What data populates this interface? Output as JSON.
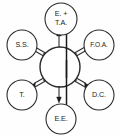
{
  "diagram": {
    "type": "hub-and-spoke",
    "background_color": "#fefefe",
    "stroke_color": "#2b2b2b",
    "text_color": "#1a1a1a",
    "hub": {
      "name": "central-hub",
      "label": "",
      "cx": 60,
      "cy": 67,
      "r": 20
    },
    "nodes": [
      {
        "id": "top",
        "name": "node-eta",
        "label_line1": "E. +",
        "label_line2": "T.A.",
        "cx": 61,
        "cy": 19,
        "r": 16,
        "two_line": true
      },
      {
        "id": "upper-left",
        "name": "node-ss",
        "label_line1": "S.S.",
        "label_line2": "",
        "cx": 22,
        "cy": 45,
        "r": 15,
        "two_line": false
      },
      {
        "id": "upper-right",
        "name": "node-foa",
        "label_line1": "F.O.A.",
        "label_line2": "",
        "cx": 99,
        "cy": 45,
        "r": 15,
        "two_line": false
      },
      {
        "id": "lower-left",
        "name": "node-t",
        "label_line1": "T.",
        "label_line2": "",
        "cx": 22,
        "cy": 95,
        "r": 15,
        "two_line": false
      },
      {
        "id": "lower-right",
        "name": "node-dc",
        "label_line1": "D.C.",
        "label_line2": "",
        "cx": 99,
        "cy": 95,
        "r": 15,
        "two_line": false
      },
      {
        "id": "bottom",
        "name": "node-ee",
        "label_line1": "E.E.",
        "label_line2": "",
        "cx": 61,
        "cy": 119,
        "r": 15,
        "two_line": false
      }
    ],
    "connectors": [
      {
        "id": "c-top",
        "name": "connector-hub-to-eta",
        "target": "top",
        "direction": "bidirectional",
        "style": "vertical-axis"
      },
      {
        "id": "c-bottom",
        "name": "connector-hub-to-ee",
        "target": "bottom",
        "direction": "bidirectional",
        "style": "vertical-axis"
      },
      {
        "id": "c-upper-left",
        "name": "connector-hub-to-ss",
        "target": "upper-left",
        "direction": "bidirectional",
        "style": "diagonal"
      },
      {
        "id": "c-upper-right",
        "name": "connector-hub-to-foa",
        "target": "upper-right",
        "direction": "bidirectional",
        "style": "diagonal"
      },
      {
        "id": "c-lower-left",
        "name": "connector-hub-to-t",
        "target": "lower-left",
        "direction": "bidirectional",
        "style": "diagonal"
      },
      {
        "id": "c-lower-right",
        "name": "connector-hub-to-dc",
        "target": "lower-right",
        "direction": "bidirectional",
        "style": "diagonal"
      }
    ]
  }
}
